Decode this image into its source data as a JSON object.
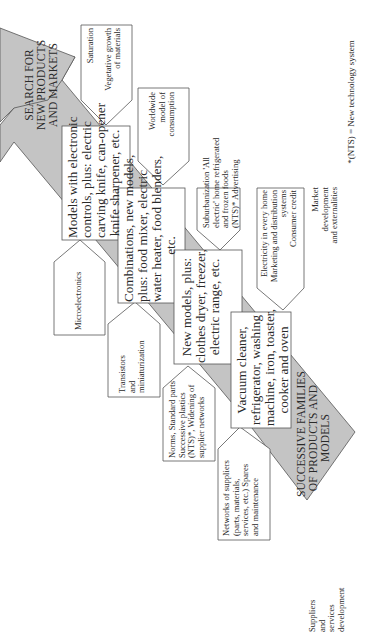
{
  "diagram": {
    "arrow_top_label": [
      "SEARCH FOR",
      "NEW PRODUCTS",
      "AND MARKETS"
    ],
    "arrow_bottom_label": [
      "SUCCESSIVE FAMILIES",
      "OF PRODUCTS AND",
      "MODELS"
    ],
    "product_boxes": [
      {
        "id": "electronic-models",
        "lines": [
          "Models with electronic",
          "controls, plus: electric",
          "carving knife, can-opener",
          "knife sharpener, etc."
        ]
      },
      {
        "id": "combinations",
        "lines": [
          "Combinations, new models,",
          "plus: food mixer, electric",
          "water heater, food blenders,",
          "etc."
        ]
      },
      {
        "id": "new-models",
        "lines": [
          "New models, plus:",
          "clothes dryer, freezer,",
          "electric range, etc."
        ]
      },
      {
        "id": "vacuum-cleaner",
        "lines": [
          "Vacuum cleaner,",
          "refrigerator, washing",
          "machine, iron, toaster,",
          "cooker and oven"
        ]
      }
    ],
    "market_boxes": [
      {
        "id": "saturation",
        "lines": [
          "Saturation",
          "",
          "Vegetative growth",
          "of materials"
        ]
      },
      {
        "id": "worldwide",
        "lines": [
          "Worldwide",
          "model of",
          "consumption"
        ]
      },
      {
        "id": "suburbanization",
        "lines": [
          "Suburbanization 'All",
          "electric' home refrigerated",
          "and frozen foods",
          "(NTS)* Advertising"
        ]
      },
      {
        "id": "electricity",
        "lines": [
          "Electricity in every home",
          "Marketing and distribution",
          "systems",
          "Consumer credit"
        ]
      }
    ],
    "market_column_label": [
      "Market",
      "development",
      "and externalities"
    ],
    "technology_boxes": [
      {
        "id": "microelectronics",
        "lines": [
          "Microelectronics"
        ]
      },
      {
        "id": "transistors",
        "lines": [
          "Transistors",
          "and",
          "miniaturization"
        ]
      },
      {
        "id": "norms",
        "lines": [
          "Norms, Standard parts",
          "Successive plastics",
          "(NTS)*, Widening of",
          "supplier networks"
        ]
      },
      {
        "id": "networks",
        "lines": [
          "Networks of suppliers",
          "(parts, materials,",
          "services, etc.) Spares",
          "and maintenance"
        ]
      }
    ],
    "supplier_column_label": [
      "Suppliers",
      "and",
      "services",
      "development"
    ],
    "footnote": "*(NTS) = New technology system",
    "colors": {
      "arrow_fill": "#c4c4c4",
      "stroke": "#555555",
      "box_fill": "#ffffff",
      "text": "#2a2a2a"
    }
  }
}
